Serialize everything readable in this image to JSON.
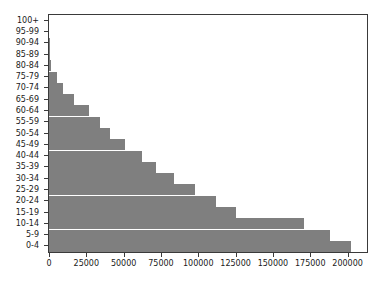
{
  "chart_data": {
    "type": "bar",
    "orientation": "horizontal",
    "title": "",
    "xlabel": "",
    "ylabel": "",
    "grid": false,
    "legend": null,
    "xlim": [
      0,
      213000
    ],
    "xticks": [
      0,
      25000,
      50000,
      75000,
      100000,
      125000,
      150000,
      175000,
      200000
    ],
    "xtick_labels": [
      "0",
      "25000",
      "50000",
      "75000",
      "100000",
      "125000",
      "150000",
      "175000",
      "200000"
    ],
    "categories": [
      "100+",
      "95-99",
      "90-94",
      "85-89",
      "80-84",
      "75-79",
      "70-74",
      "65-69",
      "60-64",
      "55-59",
      "50-54",
      "45-49",
      "40-44",
      "35-39",
      "30-34",
      "25-29",
      "20-24",
      "15-19",
      "10-14",
      "5-9",
      "0-4"
    ],
    "values": [
      0,
      200,
      500,
      800,
      1600,
      5600,
      9700,
      17000,
      26500,
      34000,
      41000,
      51000,
      62000,
      72000,
      84000,
      98000,
      112000,
      125000,
      171000,
      188000,
      202000
    ],
    "bar_color": "#7f7f7f",
    "axis_color": "#3a3a3a",
    "background_color": "#ffffff"
  }
}
